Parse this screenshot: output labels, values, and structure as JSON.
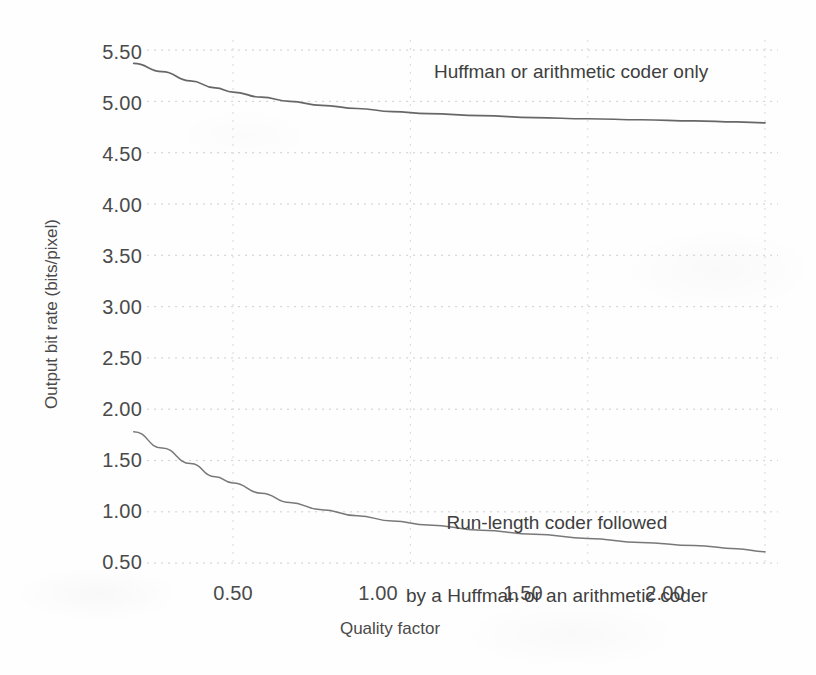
{
  "axes": {
    "x_title": "Quality factor",
    "y_title": "Output bit rate (bits/pixel)",
    "x_ticks": [
      "0.50",
      "1.00",
      "1.50",
      "2.00"
    ],
    "y_ticks": [
      "5.50",
      "5.00",
      "4.50",
      "4.00",
      "3.50",
      "3.00",
      "2.50",
      "2.00",
      "1.50",
      "1.00",
      "0.50"
    ]
  },
  "annotations": {
    "upper": "Huffman or arithmetic coder only",
    "lower_line1": "Run-length coder followed",
    "lower_line2": "by a Huffman or an arithmetic coder"
  },
  "colors": {
    "ink": "#4a4a4a",
    "curve": "#5a5a5a",
    "grid": "#d8d8d8",
    "paper": "#fefefe"
  },
  "chart_data": {
    "type": "line",
    "title": "",
    "xlabel": "Quality factor",
    "ylabel": "Output bit rate (bits/pixel)",
    "xlim": [
      0.0,
      2.05
    ],
    "ylim": [
      0.25,
      5.75
    ],
    "xticks": [
      0.5,
      1.0,
      1.5,
      2.0
    ],
    "yticks": [
      0.5,
      1.0,
      1.5,
      2.0,
      2.5,
      3.0,
      3.5,
      4.0,
      4.5,
      5.0,
      5.5
    ],
    "grid": true,
    "grid_style": "dotted",
    "legend": "annotations-inline",
    "series": [
      {
        "name": "Huffman or arithmetic coder only",
        "annotation": "Huffman or arithmetic coder only",
        "x": [
          0.22,
          0.3,
          0.38,
          0.45,
          0.5,
          0.58,
          0.66,
          0.75,
          0.85,
          0.95,
          1.05,
          1.2,
          1.35,
          1.5,
          1.65,
          1.8,
          1.92,
          2.0
        ],
        "y": [
          5.37,
          5.29,
          5.2,
          5.13,
          5.09,
          5.04,
          5.0,
          4.96,
          4.93,
          4.9,
          4.88,
          4.86,
          4.84,
          4.83,
          4.82,
          4.81,
          4.8,
          4.79
        ]
      },
      {
        "name": "Run-length coder followed by a Huffman or an arithmetic coder",
        "annotation": "Run-length coder followed\nby a Huffman or an arithmetic coder",
        "x": [
          0.22,
          0.3,
          0.38,
          0.45,
          0.5,
          0.58,
          0.66,
          0.75,
          0.85,
          0.95,
          1.05,
          1.2,
          1.35,
          1.5,
          1.65,
          1.8,
          1.92,
          2.0
        ],
        "y": [
          1.78,
          1.62,
          1.47,
          1.34,
          1.28,
          1.18,
          1.09,
          1.02,
          0.96,
          0.91,
          0.87,
          0.82,
          0.78,
          0.74,
          0.7,
          0.67,
          0.64,
          0.61
        ]
      }
    ]
  }
}
